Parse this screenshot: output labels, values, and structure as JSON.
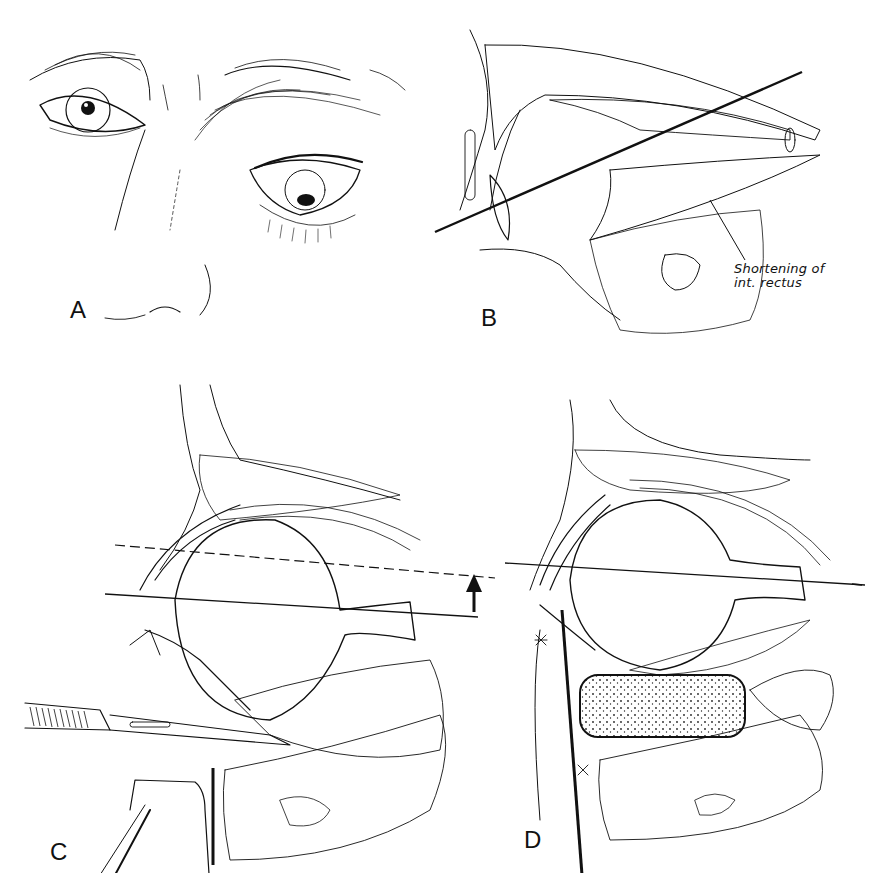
{
  "figure": {
    "panels": [
      {
        "id": "A",
        "label": "A",
        "subject": "frontal face view, right eye displaced downward"
      },
      {
        "id": "B",
        "label": "B",
        "subject": "sagittal orbit section with axis line",
        "annotation": {
          "line1": "Shortening of",
          "line2": "int. rectus"
        }
      },
      {
        "id": "C",
        "label": "C",
        "subject": "sagittal section with scalpel, dashed and solid axis lines, upward arrow"
      },
      {
        "id": "D",
        "label": "D",
        "subject": "sagittal section with orbital floor implant, corrected axis line"
      }
    ]
  },
  "colors": {
    "ink": "#111111",
    "background": "#ffffff",
    "hatch": "#333333"
  }
}
